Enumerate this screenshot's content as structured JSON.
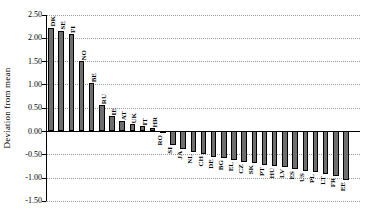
{
  "chart_data": {
    "type": "bar",
    "title": "",
    "ylabel": "Deviation from mean",
    "xlabel": "",
    "categories": [
      "DK",
      "SE",
      "FI",
      "NO",
      "BE",
      "RU",
      "IE",
      "AT",
      "UK",
      "IT",
      "HR",
      "RO",
      "SI",
      "JA",
      "NL",
      "CH",
      "DE",
      "BG",
      "EL",
      "CZ",
      "SK",
      "PT",
      "HU",
      "LV",
      "ES",
      "US",
      "PL",
      "LT",
      "FR",
      "EE"
    ],
    "values": [
      2.22,
      2.15,
      2.09,
      1.5,
      1.02,
      0.55,
      0.32,
      0.22,
      0.15,
      0.1,
      0.06,
      -0.04,
      -0.31,
      -0.39,
      -0.45,
      -0.5,
      -0.55,
      -0.59,
      -0.63,
      -0.66,
      -0.69,
      -0.72,
      -0.75,
      -0.78,
      -0.81,
      -0.85,
      -0.89,
      -0.93,
      -0.97,
      -1.05
    ],
    "yticks": [
      2.5,
      2.0,
      1.5,
      1.0,
      0.5,
      0.0,
      -0.5,
      -1.0,
      -1.5
    ],
    "ytick_labels": [
      "2.50",
      "2.00",
      "1.50",
      "1.00",
      "0.50",
      "0.00",
      "-0.50",
      "-1.00",
      "-1.50"
    ],
    "ylim": [
      -1.5,
      2.5
    ],
    "grid": "horizontal-dotted",
    "legend": null,
    "bar_color": "#6e6e6e",
    "bar_border_color": "#000000",
    "label_rotation": "vertical",
    "label_position": "outside-end"
  }
}
